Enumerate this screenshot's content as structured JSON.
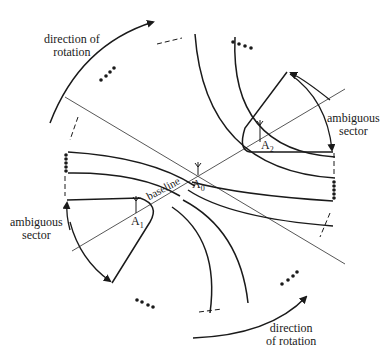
{
  "diagram": {
    "labels": {
      "rotation_top_line1": "direction of",
      "rotation_top_line2": "rotation",
      "rotation_bottom_line1": "direction",
      "rotation_bottom_line2": "of rotation",
      "ambiguous_right_line1": "ambiguous",
      "ambiguous_right_line2": "sector",
      "ambiguous_left_line1": "ambiguous",
      "ambiguous_left_line2": "sector",
      "baseline": "baseline"
    },
    "antennas": [
      {
        "id": "A0",
        "letter": "A",
        "sub": "0"
      },
      {
        "id": "A1",
        "letter": "A",
        "sub": "1"
      },
      {
        "id": "A2",
        "letter": "A",
        "sub": "2"
      }
    ],
    "colors": {
      "ink": "#1a1a1a",
      "thin_line": "#444444",
      "background": "#ffffff"
    }
  }
}
